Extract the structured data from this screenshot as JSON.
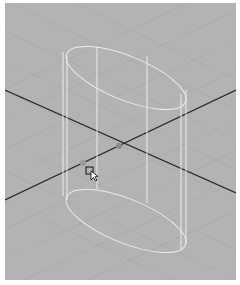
{
  "viewport": {
    "background": "#b3b3b3",
    "grid_color": "#a8a8a8",
    "axis_color": "#2a2a2a",
    "wireframe_color": "#ececec"
  },
  "scene": {
    "object": "cylinder",
    "display": "wireframe",
    "origin_marker": "pivot-dot"
  },
  "cursor": {
    "icon": "select-arrow-with-box",
    "x": 90,
    "y": 171
  }
}
